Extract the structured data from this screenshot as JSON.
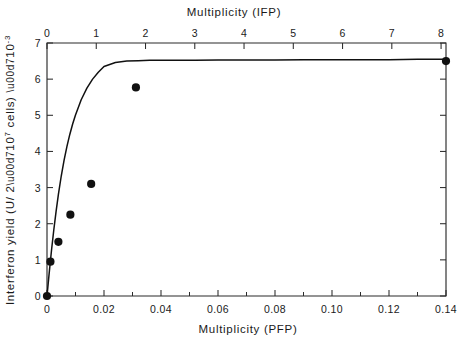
{
  "figure": {
    "background": "#ffffff",
    "ink_color": "#111111"
  },
  "axes": {
    "top": {
      "title": "Multiplicity (IFP)",
      "tick_labels": [
        "0",
        "1",
        "2",
        "3",
        "4",
        "5",
        "6",
        "7",
        "8"
      ],
      "range": [
        0,
        8.1
      ],
      "minor_ticks": false
    },
    "bottom": {
      "title": "Multiplicity (PFP)",
      "tick_labels": [
        "0",
        "0.02",
        "0.04",
        "0.06",
        "0.08",
        "0.10",
        "0.12",
        "0.14"
      ],
      "tick_values": [
        0,
        0.02,
        0.04,
        0.06,
        0.08,
        0.1,
        0.12,
        0.14
      ],
      "minor_tick_values": [
        0.01,
        0.03,
        0.05,
        0.07,
        0.09,
        0.11,
        0.13
      ],
      "range": [
        0,
        0.14
      ]
    },
    "left": {
      "title": "Interferon yield  (U/ 2×10⁷ cells)  ×10⁻³",
      "tick_labels": [
        "0",
        "1",
        "2",
        "3",
        "4",
        "5",
        "6",
        "7"
      ],
      "tick_values": [
        0,
        1,
        2,
        3,
        4,
        5,
        6,
        7
      ],
      "range": [
        0,
        7
      ]
    },
    "right": {
      "tick_labels": [],
      "tick_values": [
        0,
        1,
        2,
        3,
        4,
        5,
        6,
        7
      ]
    }
  },
  "chart_data": {
    "type": "scatter",
    "title": "",
    "subtitle": "",
    "xlabel": "Multiplicity (PFP)",
    "ylabel": "Interferon yield (U/ 2×10⁷ cells) ×10⁻³",
    "xlabel_secondary": "Multiplicity (IFP)",
    "xlim": [
      0,
      0.14
    ],
    "ylim": [
      0,
      7
    ],
    "xlim_secondary": [
      0,
      8.1
    ],
    "grid": false,
    "legend": "none",
    "marker": "filled-circle",
    "series": [
      {
        "name": "Interferon yield vs multiplicity",
        "x": [
          0,
          0.0012,
          0.004,
          0.0082,
          0.0155,
          0.0312,
          0.14
        ],
        "y": [
          0,
          0.95,
          1.5,
          2.25,
          3.1,
          5.77,
          6.5
        ]
      }
    ],
    "fit_curve": {
      "name": "saturation fit",
      "description": "Saturating (hyperbolic-type) curve rising steeply from the origin and approaching an asymptote near 6.55",
      "asymptote": 6.55,
      "half_saturation_x": 0.0072,
      "x": [
        0,
        0.0008,
        0.0016,
        0.0024,
        0.0032,
        0.004,
        0.005,
        0.006,
        0.007,
        0.008,
        0.009,
        0.01,
        0.012,
        0.014,
        0.016,
        0.018,
        0.02,
        0.024,
        0.028,
        0.032,
        0.036,
        0.04,
        0.046,
        0.052,
        0.06,
        0.07,
        0.08,
        0.09,
        0.1,
        0.11,
        0.12,
        0.13,
        0.14
      ],
      "y": [
        0,
        0.66,
        1.28,
        1.84,
        2.35,
        2.81,
        3.32,
        3.76,
        4.14,
        4.47,
        4.76,
        5.01,
        5.43,
        5.75,
        6.0,
        6.19,
        6.35,
        6.46,
        6.5,
        6.51,
        6.52,
        6.52,
        6.52,
        6.52,
        6.53,
        6.53,
        6.53,
        6.54,
        6.54,
        6.54,
        6.54,
        6.55,
        6.55
      ]
    }
  },
  "plot_area": {
    "left_px": 47,
    "right_px": 446,
    "top_px": 43,
    "bottom_px": 296
  }
}
